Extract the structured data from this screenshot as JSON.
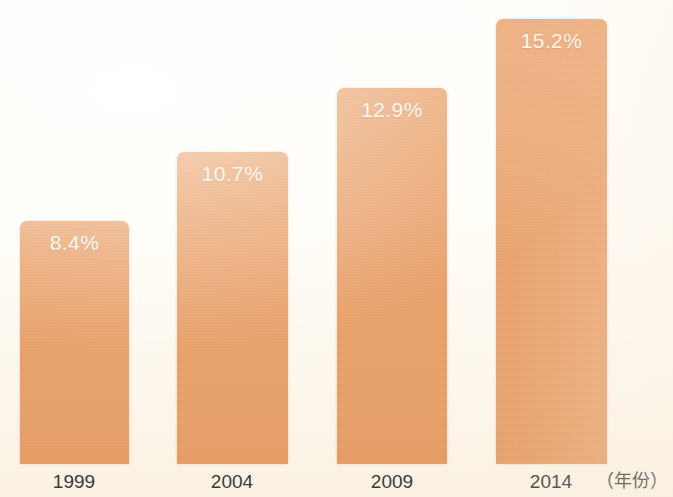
{
  "chart_data": {
    "type": "bar",
    "title": "",
    "subtitle": "",
    "xlabel": "（年份）",
    "ylabel": "",
    "categories": [
      "1999",
      "2004",
      "2009",
      "2014"
    ],
    "values": [
      8.4,
      10.7,
      12.9,
      15.2
    ],
    "value_labels": [
      "8.4%",
      "10.7%",
      "12.9%",
      "15.2%"
    ],
    "ylim": [
      0,
      16.1
    ],
    "grid": false,
    "legend": null,
    "series": [
      {
        "name": "",
        "values": [
          8.4,
          10.7,
          12.9,
          15.2
        ]
      }
    ],
    "colors": {
      "bar_fill": "#e8a069",
      "bar_fill_top": "#eba875",
      "bar_fill_bottom": "#e59c63",
      "value_label_text": "#fdf5ec",
      "axis_label_text": "#3a3a3a",
      "background": "#fffdf8"
    }
  },
  "axis": {
    "unit_label": "（年份）"
  },
  "bars": [
    {
      "label": "1999",
      "value_label": "8.4%",
      "x": 20,
      "width": 109,
      "height": 243
    },
    {
      "label": "2004",
      "value_label": "10.7%",
      "x": 177,
      "width": 111,
      "height": 312
    },
    {
      "label": "2009",
      "value_label": "12.9%",
      "x": 337,
      "width": 110,
      "height": 376
    },
    {
      "label": "2014",
      "value_label": "15.2%",
      "x": 496,
      "width": 111,
      "height": 445
    }
  ],
  "ticks": [
    {
      "label": "1999",
      "center": 74
    },
    {
      "label": "2004",
      "center": 232
    },
    {
      "label": "2009",
      "center": 392
    },
    {
      "label": "2014",
      "center": 551
    }
  ]
}
